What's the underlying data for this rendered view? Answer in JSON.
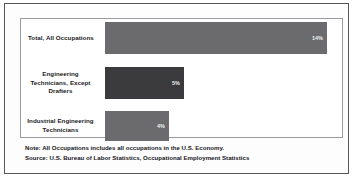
{
  "chart_data": {
    "type": "bar",
    "orientation": "horizontal",
    "title": "",
    "xlabel": "",
    "ylabel": "",
    "categories": [
      "Total, All Occupations",
      "Engineering Technicians, Except Drafters",
      "Industrial Engineering Technicians"
    ],
    "values": [
      14,
      5,
      4
    ],
    "value_labels": [
      "14%",
      "5%",
      "4%"
    ],
    "bars": [
      {
        "label_lines": [
          "Total, All Occupations"
        ],
        "value": 14,
        "value_label": "14%",
        "bar_px_width": 222,
        "color": "#6b6b6e"
      },
      {
        "label_lines": [
          "Engineering",
          "Technicians, Except",
          "Drafters"
        ],
        "value": 5,
        "value_label": "5%",
        "bar_px_width": 79,
        "color": "#3b3b3e"
      },
      {
        "label_lines": [
          "Industrial Engineering",
          "Technicians"
        ],
        "value": 4,
        "value_label": "4%",
        "bar_px_width": 64,
        "color": "#6b6b6e"
      }
    ],
    "grid": false,
    "legend": null,
    "axis_visible": false
  },
  "notes": {
    "note": "Note: All Occupations includes all occupations in the U.S. Economy.",
    "source": "Source: U.S. Bureau of Labor Statistics, Occupational Employment Statistics"
  },
  "colors": {
    "bar_light": "#6b6b6e",
    "bar_dark": "#3b3b3e",
    "outer_border": "#55565a",
    "plot_border": "#9a9a9e",
    "value_text": "#f2f2f2",
    "label_text": "#1a1a1a"
  }
}
